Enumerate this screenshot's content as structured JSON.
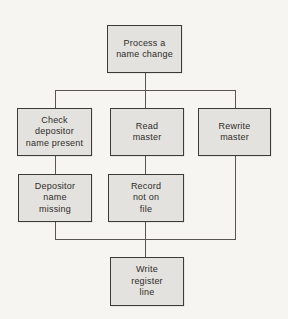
{
  "diagram": {
    "type": "structure-chart",
    "nodes": [
      {
        "id": "process-a-name-change",
        "label": "Process a\nname change"
      },
      {
        "id": "check-depositor-name-present",
        "label": "Check\ndepositor\nname present"
      },
      {
        "id": "read-master",
        "label": "Read\nmaster"
      },
      {
        "id": "rewrite-master",
        "label": "Rewrite\nmaster"
      },
      {
        "id": "depositor-name-missing",
        "label": "Depositor\nname\nmissing"
      },
      {
        "id": "record-not-on-file",
        "label": "Record\nnot on\nfile"
      },
      {
        "id": "write-register-line",
        "label": "Write\nregister\nline"
      }
    ],
    "edges": [
      {
        "from": "process-a-name-change",
        "to": "check-depositor-name-present"
      },
      {
        "from": "process-a-name-change",
        "to": "read-master"
      },
      {
        "from": "process-a-name-change",
        "to": "rewrite-master"
      },
      {
        "from": "check-depositor-name-present",
        "to": "depositor-name-missing"
      },
      {
        "from": "read-master",
        "to": "record-not-on-file"
      },
      {
        "from": "depositor-name-missing",
        "to": "write-register-line"
      },
      {
        "from": "record-not-on-file",
        "to": "write-register-line"
      },
      {
        "from": "rewrite-master",
        "to": "write-register-line"
      }
    ],
    "colors": {
      "background": "#f7f5f1",
      "box_fill": "#e4e2de",
      "box_border": "#3d3b38",
      "line": "#59564f",
      "text": "#2e2c29"
    }
  }
}
